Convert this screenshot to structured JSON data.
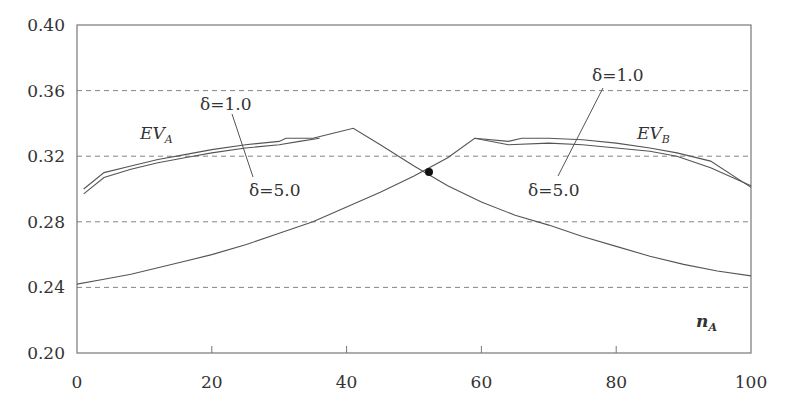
{
  "chart_data": {
    "type": "line",
    "title": "",
    "xlabel": "n_A",
    "ylabel": "",
    "xlim": [
      0,
      100
    ],
    "ylim": [
      0.2,
      0.4
    ],
    "grid": "horizontal dashed",
    "legend": "none (inline annotations)",
    "x_ticks": [
      "0",
      "20",
      "40",
      "60",
      "80",
      "100"
    ],
    "y_ticks": [
      "0.20",
      "0.24",
      "0.28",
      "0.32",
      "0.36",
      "0.40"
    ],
    "xlabel_display": {
      "main": "n",
      "sub": "A"
    },
    "series": [
      {
        "name": "EV_A (δ=1.0)",
        "x": [
          1,
          4,
          8,
          12,
          16,
          20,
          25,
          30,
          31,
          35,
          38,
          41,
          45,
          50,
          55,
          60,
          65,
          70,
          75,
          80,
          85,
          90,
          95,
          100
        ],
        "values": [
          0.3,
          0.31,
          0.314,
          0.318,
          0.321,
          0.324,
          0.327,
          0.329,
          0.331,
          0.331,
          0.334,
          0.337,
          0.327,
          0.314,
          0.302,
          0.292,
          0.284,
          0.278,
          0.271,
          0.265,
          0.259,
          0.254,
          0.25,
          0.247
        ]
      },
      {
        "name": "EV_A (δ=5.0)",
        "x": [
          1,
          4,
          8,
          12,
          16,
          20,
          25,
          30,
          33,
          36
        ],
        "values": [
          0.297,
          0.307,
          0.312,
          0.316,
          0.319,
          0.322,
          0.325,
          0.327,
          0.329,
          0.331
        ]
      },
      {
        "name": "EV_B (δ=1.0)",
        "x": [
          0,
          4,
          8,
          12,
          16,
          20,
          25,
          30,
          35,
          40,
          45,
          50,
          55,
          59,
          64,
          66,
          70,
          75,
          80,
          85,
          89,
          94,
          100
        ],
        "values": [
          0.242,
          0.245,
          0.248,
          0.252,
          0.256,
          0.26,
          0.266,
          0.273,
          0.28,
          0.289,
          0.298,
          0.308,
          0.319,
          0.331,
          0.329,
          0.331,
          0.331,
          0.33,
          0.328,
          0.325,
          0.322,
          0.317,
          0.301
        ]
      },
      {
        "name": "EV_B (δ=5.0)",
        "x": [
          59,
          64,
          70,
          75,
          80,
          85,
          89,
          94,
          100
        ],
        "values": [
          0.331,
          0.327,
          0.328,
          0.327,
          0.325,
          0.323,
          0.32,
          0.313,
          0.302
        ]
      }
    ],
    "annotations": [
      {
        "text": "EV_A",
        "x": 9,
        "y": 0.338
      },
      {
        "text": "EV_B",
        "x": 86,
        "y": 0.338
      },
      {
        "text": "δ=1.0",
        "x": 18,
        "y": 0.347,
        "points_to": "EV_A upper curve"
      },
      {
        "text": "δ=5.0",
        "x": 26,
        "y": 0.305,
        "points_to": "EV_A lower curve"
      },
      {
        "text": "δ=1.0",
        "x": 71,
        "y": 0.362,
        "points_to": "EV_B upper curve"
      },
      {
        "text": "δ=5.0",
        "x": 66,
        "y": 0.305,
        "points_to": "EV_B lower curve"
      },
      {
        "text": "intersection point",
        "x": 52,
        "y": 0.311
      }
    ]
  },
  "labels": {
    "ev_a_main": "EV",
    "ev_a_sub": "A",
    "ev_b_main": "EV",
    "ev_b_sub": "B",
    "delta1_left": "δ=1.0",
    "delta5_left": "δ=5.0",
    "delta1_right": "δ=1.0",
    "delta5_right": "δ=5.0",
    "xlabel_main": "n",
    "xlabel_sub": "A"
  },
  "colors": {
    "line": "#555555",
    "grid": "#777777",
    "text": "#333333",
    "marker": "#111111"
  }
}
